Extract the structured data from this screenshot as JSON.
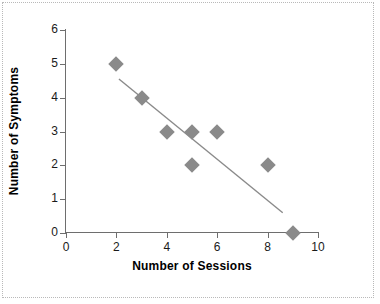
{
  "chart_data": {
    "type": "scatter",
    "title": "",
    "xlabel": "Number of Sessions",
    "ylabel": "Number of Symptoms",
    "xlim": [
      0,
      10
    ],
    "ylim": [
      0,
      6
    ],
    "xticks": [
      0,
      2,
      4,
      6,
      8,
      10
    ],
    "yticks": [
      0,
      1,
      2,
      3,
      4,
      5,
      6
    ],
    "xtick_labels": [
      "0",
      "2",
      "4",
      "6",
      "8",
      "10"
    ],
    "ytick_labels": [
      "0",
      "1",
      "2",
      "3",
      "4",
      "5",
      "6"
    ],
    "grid": false,
    "legend": false,
    "marker_shape": "diamond",
    "marker_color": "#8a8a8a",
    "line_color": "#8a8a8a",
    "axis_color": "#6e6e6e",
    "points": [
      {
        "x": 2,
        "y": 5
      },
      {
        "x": 3,
        "y": 4
      },
      {
        "x": 4,
        "y": 3
      },
      {
        "x": 5,
        "y": 3
      },
      {
        "x": 5,
        "y": 2
      },
      {
        "x": 6,
        "y": 3
      },
      {
        "x": 8,
        "y": 2
      },
      {
        "x": 9,
        "y": 0
      }
    ],
    "trendline": {
      "type": "linear-fit",
      "x_start": 2.1,
      "y_start": 4.55,
      "x_end": 8.6,
      "y_end": 0.6
    }
  },
  "figure": {
    "border_style": "dotted",
    "border_color": "#b9b9b9",
    "background": "#ffffff"
  }
}
